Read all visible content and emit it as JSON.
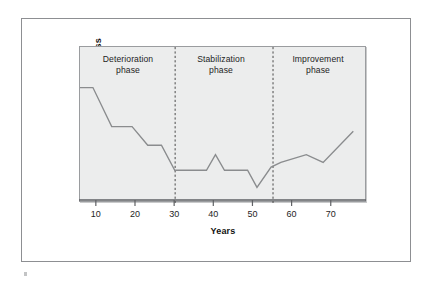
{
  "figure": {
    "background_color": "#ffffff",
    "frame_color": "#8d8f92",
    "panel_color": "#eceded",
    "line_color": "#8a8c8e",
    "divider_color": "#4a4a4a",
    "speck_name": "scan-artifact-speck"
  },
  "axes": {
    "x_title": "Years",
    "y_title": "Course of illness",
    "x_ticks": [
      {
        "label": "10",
        "value": 10
      },
      {
        "label": "20",
        "value": 20
      },
      {
        "label": "30",
        "value": 30
      },
      {
        "label": "40",
        "value": 40
      },
      {
        "label": "50",
        "value": 50
      },
      {
        "label": "60",
        "value": 60
      },
      {
        "label": "70",
        "value": 70
      }
    ]
  },
  "phases": [
    {
      "id": "deterioration",
      "label": "Deterioration\nphase",
      "start_year": 5.7,
      "end_year": 30
    },
    {
      "id": "stabilization",
      "label": "Stabilization\nphase",
      "start_year": 30,
      "end_year": 55
    },
    {
      "id": "improvement",
      "label": "Improvement\nphase",
      "start_year": 55,
      "end_year": 79
    }
  ],
  "dividers": [
    {
      "label": "30",
      "value": 30
    },
    {
      "label": "55",
      "value": 55
    }
  ],
  "chart_data": {
    "type": "line",
    "title": "",
    "subtitle": "",
    "xlabel": "Years",
    "ylabel": "Course of illness",
    "xlim": [
      5.7,
      79
    ],
    "ylim": [
      0,
      100
    ],
    "grid": false,
    "legend_position": "none",
    "y_axis_ticks_shown": false,
    "x_tick_labels": [
      "10",
      "20",
      "30",
      "40",
      "50",
      "60",
      "70"
    ],
    "x_tick_values": [
      10,
      20,
      30,
      40,
      50,
      60,
      70
    ],
    "annotations": [
      {
        "text": "Deterioration phase",
        "x_range": [
          5.7,
          30
        ]
      },
      {
        "text": "Stabilization phase",
        "x_range": [
          30,
          55
        ]
      },
      {
        "text": "Improvement phase",
        "x_range": [
          55,
          79
        ]
      }
    ],
    "vertical_dashed_lines_at_x": [
      30,
      55
    ],
    "series": [
      {
        "name": "Course of illness",
        "color": "#8a8c8e",
        "x": [
          5.7,
          9.0,
          13.8,
          19.0,
          23.0,
          26.5,
          29.9,
          38.0,
          40.3,
          42.6,
          48.5,
          50.9,
          54.5,
          57.0,
          63.5,
          67.8,
          75.5
        ],
        "y": [
          74,
          74,
          49,
          49,
          37,
          37,
          21,
          21,
          31,
          21,
          21,
          10,
          23,
          26,
          31,
          26,
          46
        ]
      }
    ]
  }
}
